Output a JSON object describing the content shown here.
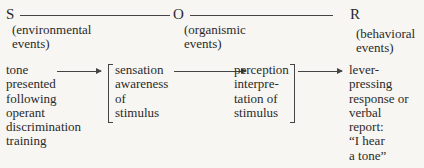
{
  "header": {
    "s": {
      "letter": "S",
      "label": "(environmental\nevents)"
    },
    "o": {
      "letter": "O",
      "label": "(organismic\nevents)"
    },
    "r": {
      "letter": "R",
      "label": "(behavioral\nevents)"
    }
  },
  "flow": {
    "stimulus": "tone\npresented\nfollowing\noperant\ndiscrimination\ntraining",
    "sensation": "sensation\nawareness\nof\nstimulus",
    "perception": "perception\ninterpre-\ntation of\nstimulus",
    "response": "lever-\npressing\nresponse or\nverbal\nreport:\n“I hear\na tone”"
  },
  "colors": {
    "ink": "#2a2a2a",
    "paper": "#f7f6f3"
  }
}
